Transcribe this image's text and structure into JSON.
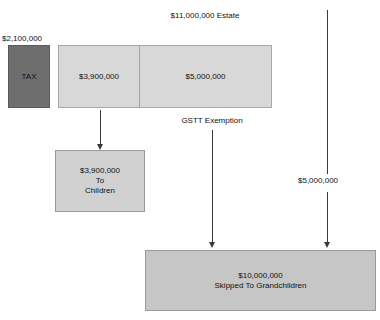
{
  "title": "GSTT Allocation Example",
  "diagram": {
    "estate_label": "$11,000,000 Estate",
    "tax_amount_label": "$2,100,000",
    "tax_box_label": "TAX",
    "estate_bar": {
      "children_share_label": "$3,900,000",
      "exemption_share_label": "$5,000,000"
    },
    "gstt_exemption_label": "GSTT Exemption",
    "children_box": {
      "amount": "$3,900,000",
      "line1": "To",
      "line2": "Children"
    },
    "right_branch_label": "$5,000,000",
    "grandchildren_box": {
      "amount": "$10,000,000",
      "caption": "Skipped To Grandchildren"
    },
    "colors": {
      "tax_fill": "#6e6e6e",
      "estate_fill": "#d8d8d8",
      "children_fill": "#d1d1d1",
      "grandchildren_fill": "#c6c6c6",
      "arrow": "#3a3a3a",
      "text": "#111111",
      "background": "#ffffff"
    }
  }
}
